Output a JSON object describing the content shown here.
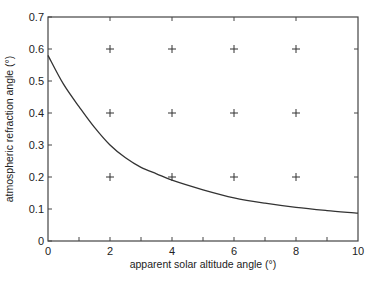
{
  "chart_data": {
    "type": "line",
    "title": "",
    "xlabel": "apparent solar altitude angle (°)",
    "ylabel": "atmospheric refraction angle (°)",
    "xlim": [
      0,
      10
    ],
    "ylim": [
      0,
      0.7
    ],
    "x_ticks": [
      0,
      2,
      4,
      6,
      8,
      10
    ],
    "x_tick_labels": [
      "0",
      "2",
      "4",
      "6",
      "8",
      "10"
    ],
    "x_minor_ticks": [
      1,
      2,
      3,
      4,
      5,
      6,
      7,
      8,
      9
    ],
    "y_ticks": [
      0,
      0.1,
      0.2,
      0.3,
      0.4,
      0.5,
      0.6,
      0.7
    ],
    "y_tick_labels": [
      "0",
      "0.1",
      "0.2",
      "0.3",
      "0.4",
      "0.5",
      "0.6",
      "0.7"
    ],
    "grid": "crosshair markers at x=2,4,6,8 and y=0.2,0.4,0.6",
    "grid_marks": {
      "x": [
        2,
        4,
        6,
        8
      ],
      "y": [
        0.2,
        0.4,
        0.6
      ]
    },
    "legend": null,
    "series": [
      {
        "name": "refraction",
        "color": "#333333",
        "x": [
          0,
          0.5,
          1,
          1.5,
          2,
          2.5,
          3,
          3.5,
          4,
          5,
          6,
          7,
          8,
          9,
          10
        ],
        "y": [
          0.58,
          0.49,
          0.42,
          0.355,
          0.3,
          0.26,
          0.23,
          0.21,
          0.19,
          0.16,
          0.135,
          0.118,
          0.105,
          0.095,
          0.087
        ]
      }
    ]
  }
}
